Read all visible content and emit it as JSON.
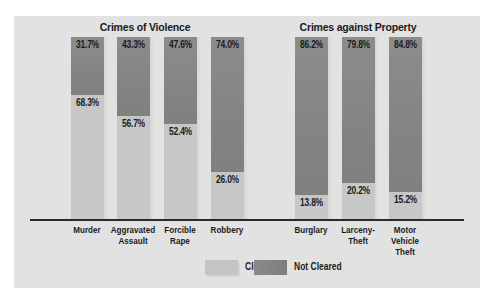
{
  "chart_data": {
    "type": "bar",
    "stacked": true,
    "percent_stacked": true,
    "title": "",
    "groups": [
      {
        "title": "Crimes of Violence",
        "categories": [
          "Murder",
          "Aggravated Assault",
          "Forcible Rape",
          "Robbery"
        ]
      },
      {
        "title": "Crimes against Property",
        "categories": [
          "Burglary",
          "Larceny-Theft",
          "Motor Vehicle Theft"
        ]
      }
    ],
    "categories": [
      "Murder",
      "Aggravated Assault",
      "Forcible Rape",
      "Robbery",
      "Burglary",
      "Larceny-Theft",
      "Motor Vehicle Theft"
    ],
    "series": [
      {
        "name": "Cleared",
        "color": "#c6c6c6",
        "values": [
          68.3,
          56.7,
          52.4,
          26.0,
          13.8,
          20.2,
          15.2
        ]
      },
      {
        "name": "Not Cleared",
        "color": "#868686",
        "values": [
          31.7,
          43.3,
          47.6,
          74.0,
          86.2,
          79.8,
          84.8
        ]
      }
    ],
    "xlabel": "",
    "ylabel": "",
    "ylim": [
      0,
      100
    ],
    "grid": false,
    "legend_position": "bottom"
  },
  "titles": {
    "violence": "Crimes of Violence",
    "property": "Crimes against Property"
  },
  "bars": [
    {
      "label": "Murder",
      "cleared": "68.3%",
      "not_cleared": "31.7%"
    },
    {
      "label": "Aggravated\nAssault",
      "cleared": "56.7%",
      "not_cleared": "43.3%"
    },
    {
      "label": "Forcible\nRape",
      "cleared": "52.4%",
      "not_cleared": "47.6%"
    },
    {
      "label": "Robbery",
      "cleared": "26.0%",
      "not_cleared": "74.0%"
    },
    {
      "label": "Burglary",
      "cleared": "13.8%",
      "not_cleared": "86.2%"
    },
    {
      "label": "Larceny-\nTheft",
      "cleared": "20.2%",
      "not_cleared": "79.8%"
    },
    {
      "label": "Motor\nVehicle\nTheft",
      "cleared": "15.2%",
      "not_cleared": "84.8%"
    }
  ],
  "legend": {
    "cleared": "Cleared",
    "not_cleared": "Not Cleared"
  }
}
